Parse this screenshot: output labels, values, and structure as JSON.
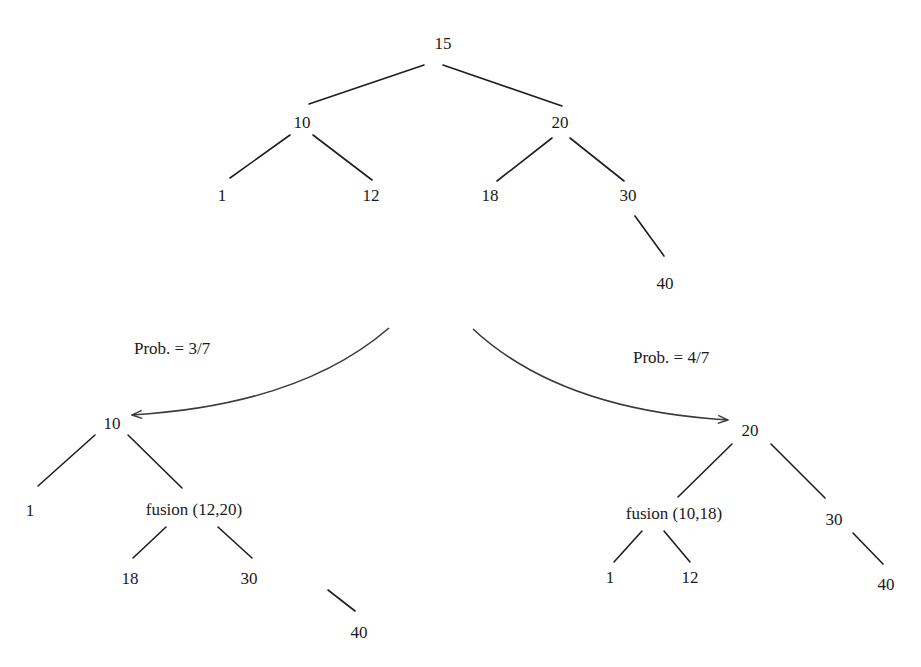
{
  "diagram": {
    "title": "",
    "colors": {
      "ink": "#1a1a1a",
      "arrow": "#3a3a3a",
      "background": "#ffffff"
    },
    "top_tree": {
      "nodes": [
        {
          "id": "t15",
          "label": "15",
          "x": 443,
          "y": 43
        },
        {
          "id": "t10",
          "label": "10",
          "x": 302,
          "y": 122
        },
        {
          "id": "t20",
          "label": "20",
          "x": 560,
          "y": 122
        },
        {
          "id": "t1",
          "label": "1",
          "x": 222,
          "y": 195
        },
        {
          "id": "t12",
          "label": "12",
          "x": 371,
          "y": 195
        },
        {
          "id": "t18",
          "label": "18",
          "x": 490,
          "y": 195
        },
        {
          "id": "t30",
          "label": "30",
          "x": 628,
          "y": 195
        },
        {
          "id": "t40",
          "label": "40",
          "x": 665,
          "y": 283
        }
      ],
      "edges": [
        {
          "x1": 424,
          "y1": 65,
          "x2": 309,
          "y2": 104
        },
        {
          "x1": 443,
          "y1": 65,
          "x2": 562,
          "y2": 106
        },
        {
          "x1": 290,
          "y1": 135,
          "x2": 230,
          "y2": 178
        },
        {
          "x1": 313,
          "y1": 135,
          "x2": 372,
          "y2": 180
        },
        {
          "x1": 552,
          "y1": 138,
          "x2": 497,
          "y2": 181
        },
        {
          "x1": 570,
          "y1": 138,
          "x2": 624,
          "y2": 181
        },
        {
          "x1": 635,
          "y1": 216,
          "x2": 664,
          "y2": 256
        }
      ]
    },
    "transitions": [
      {
        "id": "left",
        "label": "Prob. = 3/7",
        "label_x": 134,
        "label_y": 350,
        "path": {
          "x1": 389,
          "y1": 328,
          "cx": 300,
          "cy": 405,
          "x2": 132,
          "y2": 415
        }
      },
      {
        "id": "right",
        "label": "Prob. = 4/7",
        "label_x": 633,
        "label_y": 359,
        "path": {
          "x1": 473,
          "y1": 329,
          "cx": 560,
          "cy": 410,
          "x2": 728,
          "y2": 420
        }
      }
    ],
    "left_tree": {
      "nodes": [
        {
          "id": "l10",
          "label": "10",
          "x": 112,
          "y": 423
        },
        {
          "id": "l1",
          "label": "1",
          "x": 30,
          "y": 510
        },
        {
          "id": "lf",
          "label": "fusion (12,20)",
          "x": 194,
          "y": 509
        },
        {
          "id": "l18",
          "label": "18",
          "x": 130,
          "y": 578
        },
        {
          "id": "l30",
          "label": "30",
          "x": 249,
          "y": 578
        },
        {
          "id": "l40",
          "label": "40",
          "x": 359,
          "y": 632
        }
      ],
      "edges": [
        {
          "x1": 95,
          "y1": 435,
          "x2": 38,
          "y2": 486
        },
        {
          "x1": 128,
          "y1": 435,
          "x2": 182,
          "y2": 488
        },
        {
          "x1": 166,
          "y1": 527,
          "x2": 133,
          "y2": 558
        },
        {
          "x1": 218,
          "y1": 527,
          "x2": 252,
          "y2": 558
        },
        {
          "x1": 328,
          "y1": 590,
          "x2": 355,
          "y2": 611
        }
      ]
    },
    "right_tree": {
      "nodes": [
        {
          "id": "r20",
          "label": "20",
          "x": 750,
          "y": 430
        },
        {
          "id": "rf",
          "label": "fusion (10,18)",
          "x": 674,
          "y": 513
        },
        {
          "id": "r30",
          "label": "30",
          "x": 834,
          "y": 519
        },
        {
          "id": "r1",
          "label": "1",
          "x": 610,
          "y": 577
        },
        {
          "id": "r12",
          "label": "12",
          "x": 690,
          "y": 577
        },
        {
          "id": "r40",
          "label": "40",
          "x": 886,
          "y": 584
        }
      ],
      "edges": [
        {
          "x1": 732,
          "y1": 444,
          "x2": 678,
          "y2": 497
        },
        {
          "x1": 771,
          "y1": 444,
          "x2": 825,
          "y2": 498
        },
        {
          "x1": 642,
          "y1": 531,
          "x2": 614,
          "y2": 562
        },
        {
          "x1": 664,
          "y1": 531,
          "x2": 690,
          "y2": 562
        },
        {
          "x1": 853,
          "y1": 533,
          "x2": 883,
          "y2": 564
        }
      ]
    }
  }
}
